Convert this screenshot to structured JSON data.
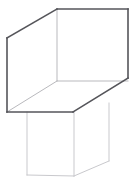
{
  "canvas": {
    "width": 136,
    "height": 188,
    "background": "#ffffff",
    "title": "3D wireframe line drawing"
  },
  "figure": {
    "name": "open-box-on-pedestal",
    "stroke_colors": {
      "strong": "#55555a",
      "mid": "#8e8e93",
      "light": "#b9b9bd",
      "faint": "#c9c9cd"
    },
    "parts": [
      {
        "name": "upper-box",
        "edges": [
          {
            "name": "upper-box-top-back-diagonal",
            "weight": "strong",
            "points": "7,38 57,9"
          },
          {
            "name": "upper-box-top-back-horizontal",
            "weight": "strong",
            "points": "57,9 128,9"
          },
          {
            "name": "upper-box-right-back-vertical",
            "weight": "strong",
            "points": "128,9 128,78"
          },
          {
            "name": "upper-box-bottom-right-diagonal",
            "weight": "strong",
            "points": "128,78 73,112"
          },
          {
            "name": "upper-box-bottom-front-horizontal",
            "weight": "strong",
            "points": "73,112 7,112"
          },
          {
            "name": "upper-box-left-front-vertical",
            "weight": "strong",
            "points": "7,112 7,38"
          },
          {
            "name": "upper-box-inner-vertical",
            "weight": "light",
            "points": "57,9 57,81"
          },
          {
            "name": "upper-box-inner-floor-left-diagonal",
            "weight": "light",
            "points": "57,81 7,112"
          },
          {
            "name": "upper-box-inner-floor-right-diagonal",
            "weight": "light",
            "points": "57,81 128,81"
          },
          {
            "name": "upper-box-inner-right-edge",
            "weight": "light",
            "points": "128,81 128,78"
          }
        ]
      },
      {
        "name": "lower-block",
        "edges": [
          {
            "name": "lower-block-left-vertical",
            "weight": "faint",
            "points": "27,112 27,175"
          },
          {
            "name": "lower-block-bottom-front-horizontal",
            "weight": "faint",
            "points": "27,175 74,176"
          },
          {
            "name": "lower-block-front-right-vertical",
            "weight": "faint",
            "points": "74,112 74,176"
          },
          {
            "name": "lower-block-bottom-right-diagonal",
            "weight": "faint",
            "points": "74,176 109,161"
          },
          {
            "name": "lower-block-right-vertical",
            "weight": "faint",
            "points": "109,103 109,161"
          }
        ]
      }
    ]
  }
}
